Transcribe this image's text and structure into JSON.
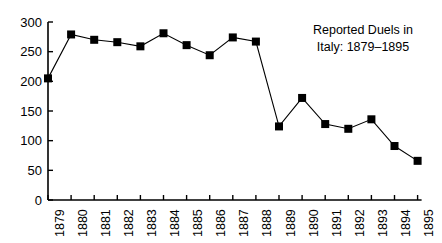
{
  "chart_data": {
    "type": "line",
    "title": "Reported Duels in Italy: 1879–1895",
    "title_lines": [
      "Reported Duels in",
      "Italy: 1879–1895"
    ],
    "xlabel": "",
    "ylabel": "",
    "categories": [
      "1879",
      "1880",
      "1881",
      "1882",
      "1883",
      "1884",
      "1885",
      "1886",
      "1887",
      "1888",
      "1889",
      "1890",
      "1891",
      "1892",
      "1893",
      "1894",
      "1895"
    ],
    "values": [
      205,
      279,
      270,
      266,
      259,
      281,
      261,
      244,
      274,
      267,
      124,
      172,
      128,
      120,
      136,
      91,
      66
    ],
    "series": [
      {
        "name": "Reported Duels",
        "values": [
          205,
          279,
          270,
          266,
          259,
          281,
          261,
          244,
          274,
          267,
          124,
          172,
          128,
          120,
          136,
          91,
          66
        ]
      }
    ],
    "ylim": [
      0,
      300
    ],
    "yticks": [
      0,
      50,
      100,
      150,
      200,
      250,
      300
    ],
    "ytick_labels": [
      "0",
      "50",
      "100",
      "150",
      "200",
      "250",
      "300"
    ],
    "xtick_labels": [
      "1879",
      "1880",
      "1881",
      "1882",
      "1883",
      "1884",
      "1885",
      "1886",
      "1887",
      "1888",
      "1889",
      "1890",
      "1891",
      "1892",
      "1893",
      "1894",
      "1895"
    ],
    "grid": false,
    "legend": false,
    "legend_position": "none",
    "marker": "square",
    "marker_color": "#000000",
    "line_color": "#000000",
    "axis_color": "#000000",
    "background_color": "#ffffff",
    "xtick_rotation": -90
  }
}
